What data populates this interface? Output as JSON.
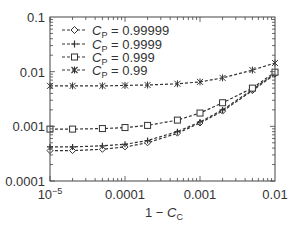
{
  "chart_data": {
    "type": "line",
    "title": "",
    "xlabel": "1 − C_C",
    "ylabel": "",
    "xscale": "log",
    "yscale": "log",
    "xlim": [
      1e-05,
      0.01
    ],
    "ylim": [
      0.0001,
      0.1
    ],
    "x_tick_labels": [
      "10^-5",
      "0.0001",
      "0.001",
      "0.01"
    ],
    "y_tick_labels": [
      "0.0001",
      "0.001",
      "0.01",
      "0.1"
    ],
    "grid": false,
    "legend_position": "upper left",
    "x": [
      1e-05,
      2e-05,
      5e-05,
      0.0001,
      0.0002,
      0.0005,
      0.001,
      0.002,
      0.005,
      0.01
    ],
    "series": [
      {
        "name": "C_P = 0.99999",
        "marker": "diamond",
        "values": [
          0.00036,
          0.00036,
          0.00038,
          0.00042,
          0.0005,
          0.00075,
          0.00115,
          0.0019,
          0.0045,
          0.009
        ]
      },
      {
        "name": "C_P = 0.9999",
        "marker": "plus",
        "values": [
          0.00042,
          0.00042,
          0.00044,
          0.00047,
          0.00055,
          0.0008,
          0.0012,
          0.002,
          0.0047,
          0.0092
        ]
      },
      {
        "name": "C_P = 0.999",
        "marker": "square",
        "values": [
          0.00089,
          0.00089,
          0.00091,
          0.00095,
          0.00104,
          0.0013,
          0.00175,
          0.0027,
          0.005,
          0.0098
        ]
      },
      {
        "name": "C_P = 0.99",
        "marker": "asterisk",
        "values": [
          0.0055,
          0.0055,
          0.0055,
          0.0056,
          0.0057,
          0.006,
          0.0065,
          0.0077,
          0.0107,
          0.0144
        ]
      }
    ]
  },
  "legend": [
    {
      "sym": "C",
      "sub": "P",
      "val": " = 0.99999"
    },
    {
      "sym": "C",
      "sub": "P",
      "val": " = 0.9999"
    },
    {
      "sym": "C",
      "sub": "P",
      "val": " = 0.999"
    },
    {
      "sym": "C",
      "sub": "P",
      "val": " = 0.99"
    }
  ],
  "axis": {
    "xlabel_prefix": "1 − ",
    "xlabel_sym": "C",
    "xlabel_sub": "C",
    "y_ticks": [
      "0.1",
      "0.01",
      "0.001",
      "0.0001"
    ],
    "x_ticks": [
      "0.0001",
      "0.001",
      "0.01"
    ],
    "x_first_base": "10",
    "x_first_exp": "−5"
  }
}
